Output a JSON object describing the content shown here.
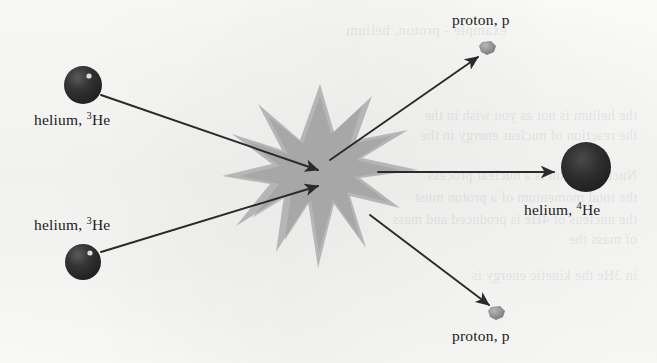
{
  "diagram": {
    "type": "physics-reaction-schematic",
    "background_color": "#fbfbfa",
    "ink_color": "#1b1b1b",
    "burst_color": "#a8a8a8",
    "nucleus_color": "#2b2b2b",
    "proton_color": "#8d8d8d",
    "reaction_equation": "3He + 3He -> 4He + p + p"
  },
  "labels": {
    "reactant_top": {
      "text_prefix": "helium, ",
      "superscript": "3",
      "element": "He"
    },
    "reactant_bottom": {
      "text_prefix": "helium, ",
      "superscript": "3",
      "element": "He"
    },
    "product_nucleus": {
      "text_prefix": "helium, ",
      "superscript": "4",
      "element": "He"
    },
    "product_proton_top": {
      "text": "proton, p"
    },
    "product_proton_bottom": {
      "text": "proton, p"
    }
  },
  "particles": [
    {
      "name": "helium-3-upper",
      "role": "reactant",
      "shape": "sphere",
      "cx": 83,
      "cy": 85,
      "r": 19,
      "color": "#2b2b2b",
      "highlight": true
    },
    {
      "name": "helium-3-lower",
      "role": "reactant",
      "shape": "sphere",
      "cx": 83,
      "cy": 262,
      "r": 18,
      "color": "#2b2b2b",
      "highlight": true
    },
    {
      "name": "helium-4",
      "role": "product",
      "shape": "sphere",
      "cx": 586,
      "cy": 167,
      "r": 25,
      "color": "#2b2b2b",
      "highlight": false
    },
    {
      "name": "proton-upper",
      "role": "product",
      "shape": "blob",
      "cx": 488,
      "cy": 48,
      "r": 7,
      "color": "#8d8d8d",
      "highlight": false
    },
    {
      "name": "proton-lower",
      "role": "product",
      "shape": "blob",
      "cx": 497,
      "cy": 313,
      "r": 7,
      "color": "#8d8d8d",
      "highlight": false
    }
  ],
  "arrows": [
    {
      "name": "inbound-upper",
      "from": [
        101,
        95
      ],
      "to": [
        318,
        170
      ],
      "direction": "into-collision"
    },
    {
      "name": "inbound-lower",
      "from": [
        101,
        252
      ],
      "to": [
        318,
        186
      ],
      "direction": "into-collision"
    },
    {
      "name": "outbound-proton-upper",
      "from": [
        330,
        160
      ],
      "to": [
        478,
        57
      ],
      "direction": "out-of-collision"
    },
    {
      "name": "outbound-helium4",
      "from": [
        378,
        172
      ],
      "to": [
        554,
        172
      ],
      "direction": "out-of-collision"
    },
    {
      "name": "outbound-proton-lower",
      "from": [
        370,
        215
      ],
      "to": [
        489,
        305
      ],
      "direction": "out-of-collision"
    }
  ],
  "collision_burst": {
    "name": "collision-starburst",
    "cx": 320,
    "cy": 176,
    "points": 10,
    "color": "#a8a8a8",
    "outer_radius": 92,
    "inner_radius": 34
  },
  "bleed_text": [
    {
      "text": "example - proton, helium",
      "x": 150,
      "y": 22,
      "size": 15
    },
    {
      "text": "the helium is not as you wish in the",
      "x": 20,
      "y": 108,
      "size": 14
    },
    {
      "text": "the reaction of nuclear energy in the",
      "x": 20,
      "y": 128,
      "size": 14
    },
    {
      "text": "Nuclear fusion is a nuclear process",
      "x": 20,
      "y": 168,
      "size": 14
    },
    {
      "text": "the total momentum of a proton must",
      "x": 20,
      "y": 190,
      "size": 14
    },
    {
      "text": "the nucleus of 4He is produced and mass",
      "x": 20,
      "y": 212,
      "size": 14
    },
    {
      "text": "of mass the",
      "x": 20,
      "y": 232,
      "size": 14
    },
    {
      "text": "in 3He the kinetic energy is",
      "x": 20,
      "y": 268,
      "size": 14
    }
  ]
}
